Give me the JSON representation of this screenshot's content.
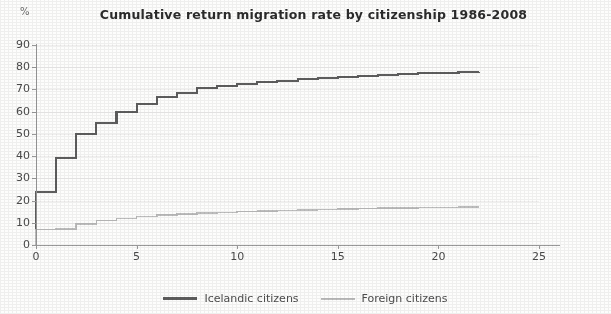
{
  "chart_data": {
    "type": "line",
    "title": "Cumulative return migration rate by citizenship 1986-2008",
    "unit_label": "%",
    "xlabel": "",
    "ylabel": "%",
    "xlim": [
      0,
      25
    ],
    "ylim": [
      0,
      90
    ],
    "xticks": [
      "0",
      "5",
      "10",
      "15",
      "20",
      "25"
    ],
    "yticks": [
      "0",
      "10",
      "20",
      "30",
      "40",
      "50",
      "60",
      "70",
      "80",
      "90"
    ],
    "grid": true,
    "legend_position": "bottom",
    "step_style": "post",
    "x": [
      0,
      1,
      2,
      3,
      4,
      5,
      6,
      7,
      8,
      9,
      10,
      11,
      12,
      13,
      14,
      15,
      16,
      17,
      18,
      19,
      20,
      21,
      22
    ],
    "series": [
      {
        "name": "Icelandic citizens",
        "color": "#5e5e5e",
        "values": [
          24,
          39,
          50,
          55,
          60,
          63.5,
          66.5,
          68.5,
          70.5,
          71.5,
          72.5,
          73.5,
          74,
          74.5,
          75,
          75.5,
          76,
          76.5,
          77,
          77.2,
          77.5,
          77.7,
          78
        ]
      },
      {
        "name": "Foreign citizens",
        "color": "#bdbdbd",
        "values": [
          7,
          7.2,
          9.5,
          11,
          12,
          12.8,
          13.4,
          13.9,
          14.3,
          14.7,
          15,
          15.3,
          15.6,
          15.8,
          16,
          16.2,
          16.4,
          16.6,
          16.7,
          16.8,
          16.9,
          17,
          17.1
        ]
      }
    ]
  },
  "legend": {
    "items": [
      {
        "label": "Icelandic citizens",
        "color": "#5e5e5e"
      },
      {
        "label": "Foreign citizens",
        "color": "#bdbdbd"
      }
    ]
  }
}
